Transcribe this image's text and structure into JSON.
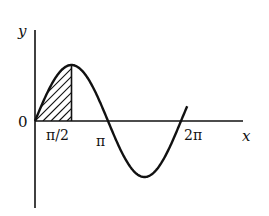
{
  "figure": {
    "function": "y = sin x",
    "shaded_region": "area under curve from 0 to π/2",
    "labels": {
      "y_axis": "y",
      "x_axis": "x",
      "origin": "0",
      "tick_half_pi": "π/2",
      "tick_pi": "π",
      "tick_two_pi": "2π"
    },
    "x_range": [
      0,
      6.55
    ],
    "shade_range": [
      0,
      1.5708
    ],
    "colors": {
      "ink": "#111111",
      "background": "#ffffff"
    }
  }
}
